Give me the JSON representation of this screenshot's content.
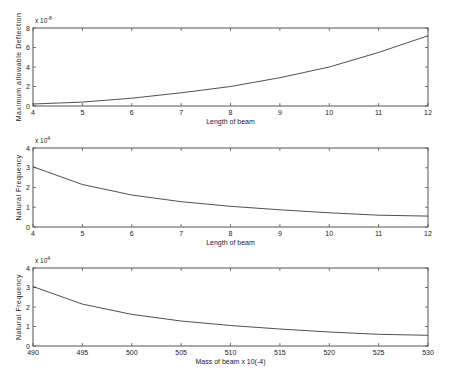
{
  "chart_data": [
    {
      "type": "line",
      "title": "",
      "xlabel": "Length of beam",
      "ylabel": "Maximum allowable Deflection",
      "y_multiplier": "x 10^-8",
      "y_multiplier_base": "x 10",
      "y_multiplier_exp": "-8",
      "xlim": [
        4,
        12
      ],
      "ylim": [
        0,
        8
      ],
      "xticks": [
        4,
        5,
        6,
        7,
        8,
        9,
        10,
        11,
        12
      ],
      "yticks": [
        0,
        2,
        4,
        6,
        8
      ],
      "grid": false,
      "x": [
        4,
        5,
        6,
        7,
        8,
        9,
        10,
        11,
        12
      ],
      "series": [
        {
          "name": "deflection",
          "values": [
            0.2,
            0.4,
            0.8,
            1.35,
            2.0,
            2.9,
            4.0,
            5.5,
            7.2
          ]
        }
      ]
    },
    {
      "type": "line",
      "title": "",
      "xlabel": "Length of beam",
      "ylabel": "Natural Frequency",
      "y_multiplier": "x 10^4",
      "y_multiplier_base": "x 10",
      "y_multiplier_exp": "4",
      "xlim": [
        4,
        12
      ],
      "ylim": [
        0,
        4
      ],
      "xticks": [
        4,
        5,
        6,
        7,
        8,
        9,
        10,
        11,
        12
      ],
      "yticks": [
        0,
        1,
        2,
        3,
        4
      ],
      "grid": false,
      "x": [
        4,
        5,
        6,
        7,
        8,
        9,
        10,
        11,
        12
      ],
      "series": [
        {
          "name": "frequency",
          "values": [
            3.05,
            2.15,
            1.62,
            1.28,
            1.05,
            0.87,
            0.72,
            0.6,
            0.55
          ]
        }
      ]
    },
    {
      "type": "line",
      "title": "",
      "xlabel": "Mass of beam x 10(-4)",
      "ylabel": "Natural Frequency",
      "y_multiplier": "x 10^4",
      "y_multiplier_base": "x 10",
      "y_multiplier_exp": "4",
      "xlim": [
        490,
        530
      ],
      "ylim": [
        0,
        4
      ],
      "xticks": [
        490,
        495,
        500,
        505,
        510,
        515,
        520,
        525,
        530
      ],
      "yticks": [
        0,
        1,
        2,
        3,
        4
      ],
      "grid": false,
      "x": [
        490,
        495,
        500,
        505,
        510,
        515,
        520,
        525,
        530
      ],
      "series": [
        {
          "name": "frequency",
          "values": [
            3.05,
            2.15,
            1.62,
            1.28,
            1.05,
            0.87,
            0.72,
            0.6,
            0.55
          ]
        }
      ]
    }
  ],
  "layout": {
    "plots": [
      {
        "left": 33,
        "right": 428,
        "top": 28,
        "bottom": 106
      },
      {
        "left": 33,
        "right": 428,
        "top": 148,
        "bottom": 227
      },
      {
        "left": 33,
        "right": 428,
        "top": 268,
        "bottom": 346
      }
    ]
  }
}
